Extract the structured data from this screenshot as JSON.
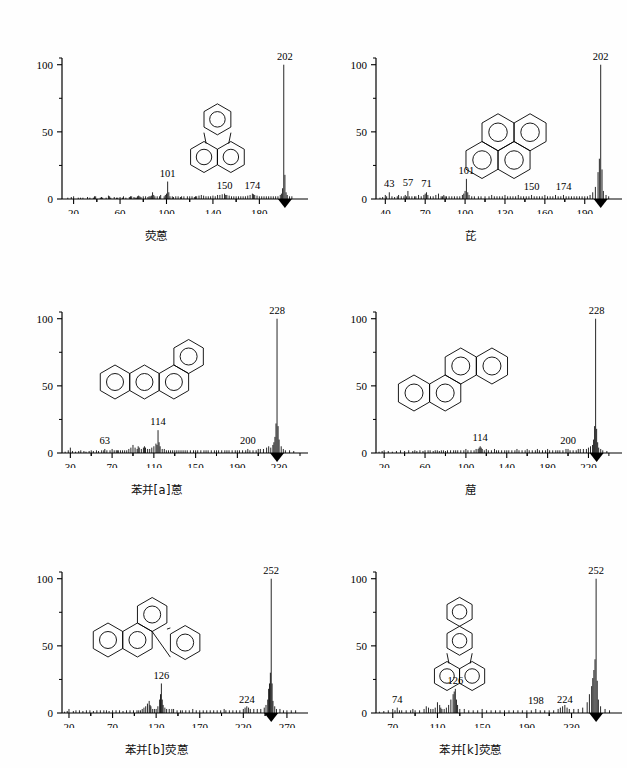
{
  "figure": {
    "type": "multi-panel-mass-spectra",
    "panel_count": 6,
    "y_axis_ticks": [
      "0",
      "50",
      "100"
    ],
    "y_minor_ticks": [
      25,
      75
    ],
    "y_range": [
      0,
      105
    ]
  },
  "chart_data": [
    {
      "type": "bar",
      "id": "panel-1",
      "title": "荧蒽",
      "title_en": "fluoranthene",
      "structure": "fluoranthene",
      "xlabel": "",
      "ylabel": "",
      "xlim": [
        10,
        215
      ],
      "ylim": [
        0,
        105
      ],
      "xticks": [
        20,
        60,
        100,
        140,
        180
      ],
      "yticks": [
        0,
        50,
        100
      ],
      "annotations": [
        {
          "mz": 101,
          "label": "101",
          "intensity": 13
        },
        {
          "mz": 150,
          "label": "150",
          "intensity": 4
        },
        {
          "mz": 174,
          "label": "174",
          "intensity": 4
        },
        {
          "mz": 202,
          "label": "202",
          "intensity": 100
        }
      ],
      "base_peak": 202,
      "x": [
        15,
        18,
        20,
        24,
        26,
        28,
        32,
        34,
        37,
        38,
        39,
        43,
        44,
        45,
        48,
        50,
        51,
        52,
        55,
        57,
        58,
        60,
        62,
        63,
        65,
        68,
        69,
        70,
        72,
        73,
        74,
        75,
        76,
        77,
        78,
        80,
        82,
        84,
        85,
        86,
        87,
        88,
        89,
        90,
        92,
        94,
        95,
        98,
        99,
        100,
        101,
        102,
        103,
        105,
        106,
        108,
        110,
        112,
        113,
        115,
        118,
        120,
        122,
        124,
        125,
        126,
        128,
        130,
        132,
        134,
        136,
        138,
        140,
        142,
        144,
        146,
        148,
        150,
        151,
        152,
        154,
        156,
        158,
        160,
        162,
        164,
        166,
        168,
        170,
        172,
        174,
        175,
        176,
        178,
        180,
        182,
        184,
        186,
        188,
        190,
        192,
        194,
        196,
        198,
        199,
        200,
        201,
        202,
        203,
        204,
        206,
        208,
        210
      ],
      "values": [
        1,
        1.5,
        2,
        1,
        1,
        1,
        1.5,
        1,
        1,
        2,
        2,
        1,
        1.5,
        1,
        1,
        2.5,
        2,
        1,
        1.5,
        1,
        1,
        1.5,
        1,
        2,
        1,
        1.5,
        2,
        2,
        1.5,
        1,
        1,
        2,
        2.5,
        2,
        1.5,
        2,
        2,
        1.5,
        2,
        2,
        2.5,
        5,
        3,
        2,
        2,
        2,
        3,
        2,
        3,
        4,
        13,
        5,
        2,
        2,
        1.5,
        2,
        2,
        1.5,
        2,
        2,
        2,
        2,
        2,
        1.5,
        2,
        2,
        2.5,
        3,
        2.5,
        2,
        2,
        2,
        2.5,
        2,
        3,
        3,
        3.5,
        4,
        3,
        3,
        2.5,
        2,
        2,
        2,
        2,
        2,
        2,
        2,
        2.5,
        3,
        4,
        3.5,
        3,
        2.5,
        2,
        2,
        2,
        2,
        2,
        2,
        2,
        2,
        2,
        3,
        4,
        8,
        100,
        18,
        5,
        3,
        2,
        2
      ]
    },
    {
      "type": "bar",
      "id": "panel-2",
      "title": "芘",
      "title_en": "pyrene",
      "structure": "pyrene",
      "xlabel": "",
      "ylabel": "",
      "xlim": [
        33,
        212
      ],
      "ylim": [
        0,
        105
      ],
      "xticks": [
        40,
        70,
        100,
        130,
        160,
        190
      ],
      "yticks": [
        0,
        50,
        100
      ],
      "annotations": [
        {
          "mz": 43,
          "label": "43",
          "intensity": 5
        },
        {
          "mz": 57,
          "label": "57",
          "intensity": 6
        },
        {
          "mz": 71,
          "label": "71",
          "intensity": 5
        },
        {
          "mz": 101,
          "label": "101",
          "intensity": 15
        },
        {
          "mz": 150,
          "label": "150",
          "intensity": 3
        },
        {
          "mz": 174,
          "label": "174",
          "intensity": 3
        },
        {
          "mz": 202,
          "label": "202",
          "intensity": 100
        }
      ],
      "base_peak": 202,
      "x": [
        36,
        38,
        40,
        41,
        43,
        45,
        47,
        49,
        50,
        52,
        54,
        55,
        56,
        57,
        58,
        60,
        62,
        63,
        65,
        67,
        69,
        70,
        71,
        72,
        74,
        76,
        78,
        80,
        82,
        83,
        84,
        85,
        86,
        88,
        90,
        92,
        94,
        96,
        98,
        99,
        100,
        101,
        102,
        103,
        105,
        107,
        110,
        112,
        115,
        118,
        120,
        122,
        124,
        126,
        128,
        130,
        132,
        134,
        136,
        138,
        140,
        142,
        144,
        146,
        148,
        150,
        152,
        154,
        156,
        158,
        160,
        162,
        164,
        166,
        168,
        170,
        172,
        174,
        176,
        178,
        180,
        182,
        184,
        186,
        188,
        190,
        192,
        194,
        196,
        198,
        200,
        201,
        202,
        203,
        204,
        206,
        208
      ],
      "values": [
        1,
        1.5,
        3,
        2,
        5,
        2,
        1.5,
        2,
        3,
        2,
        2,
        3,
        2,
        6,
        2,
        2,
        2,
        2,
        3,
        2,
        3,
        4,
        5,
        3,
        2,
        2,
        3,
        4,
        2,
        2,
        3,
        2,
        2,
        2,
        2,
        2,
        2,
        2,
        3,
        4,
        6,
        15,
        5,
        3,
        2,
        2,
        2,
        2,
        2,
        2,
        3,
        2,
        2,
        2,
        2,
        3,
        2,
        2,
        2,
        2,
        3,
        2,
        2,
        2,
        2,
        3,
        2,
        2,
        2,
        2,
        3,
        2,
        2,
        2,
        3,
        2,
        2,
        3,
        2,
        2,
        2,
        2,
        2,
        2,
        2,
        2,
        2,
        3,
        5,
        9,
        20,
        30,
        100,
        22,
        6,
        3,
        2
      ]
    },
    {
      "type": "bar",
      "id": "panel-3",
      "title": "苯并[a]蒽",
      "title_en": "benzo[a]anthracene",
      "structure": "benzo-a-anthracene",
      "xlabel": "",
      "ylabel": "",
      "xlim": [
        22,
        250
      ],
      "ylim": [
        0,
        105
      ],
      "xticks": [
        30,
        70,
        110,
        150,
        190,
        230
      ],
      "yticks": [
        0,
        50,
        100
      ],
      "annotations": [
        {
          "mz": 63,
          "label": "63",
          "intensity": 3
        },
        {
          "mz": 114,
          "label": "114",
          "intensity": 17
        },
        {
          "mz": 200,
          "label": "200",
          "intensity": 3
        },
        {
          "mz": 228,
          "label": "228",
          "intensity": 100
        }
      ],
      "base_peak": 228,
      "x": [
        25,
        28,
        30,
        32,
        35,
        38,
        40,
        43,
        45,
        48,
        50,
        52,
        55,
        57,
        60,
        62,
        63,
        65,
        68,
        70,
        72,
        74,
        75,
        76,
        78,
        80,
        82,
        84,
        86,
        88,
        90,
        92,
        94,
        95,
        96,
        98,
        100,
        101,
        102,
        104,
        106,
        108,
        110,
        112,
        113,
        114,
        115,
        116,
        118,
        120,
        122,
        124,
        126,
        128,
        130,
        132,
        134,
        136,
        138,
        140,
        142,
        145,
        148,
        150,
        152,
        155,
        158,
        160,
        162,
        165,
        168,
        170,
        172,
        175,
        178,
        180,
        182,
        185,
        188,
        190,
        192,
        195,
        198,
        200,
        202,
        205,
        208,
        210,
        212,
        215,
        218,
        220,
        222,
        224,
        225,
        226,
        227,
        228,
        229,
        230,
        232,
        234,
        236,
        240,
        244
      ],
      "values": [
        1,
        2,
        4,
        1.5,
        1,
        1.5,
        2,
        1.5,
        1,
        1.5,
        2,
        1.5,
        2,
        1.5,
        2,
        2,
        3,
        2,
        2,
        3,
        2,
        2,
        2,
        2,
        2,
        2,
        2,
        2,
        3,
        4,
        6,
        4,
        3,
        5,
        4,
        3,
        4,
        5,
        4,
        3,
        3,
        4,
        5,
        7,
        6,
        17,
        8,
        5,
        3,
        3,
        2,
        2,
        2,
        2,
        2,
        2,
        2,
        2,
        2,
        2,
        2,
        2,
        2,
        2,
        2,
        2,
        2,
        2,
        2,
        2,
        2,
        2,
        2,
        2,
        2,
        2,
        2,
        2,
        2,
        2,
        2,
        2,
        2,
        3,
        2,
        2,
        2,
        3,
        3,
        3,
        4,
        5,
        4,
        6,
        8,
        12,
        22,
        100,
        20,
        10,
        5,
        3,
        2,
        2,
        1.5
      ]
    },
    {
      "type": "bar",
      "id": "panel-4",
      "title": "䓛",
      "title_en": "chrysene",
      "structure": "chrysene",
      "xlabel": "",
      "ylabel": "",
      "xlim": [
        12,
        245
      ],
      "ylim": [
        0,
        105
      ],
      "xticks": [
        20,
        60,
        100,
        140,
        180,
        220
      ],
      "yticks": [
        0,
        50,
        100
      ],
      "annotations": [
        {
          "mz": 114,
          "label": "114",
          "intensity": 5
        },
        {
          "mz": 200,
          "label": "200",
          "intensity": 3
        },
        {
          "mz": 228,
          "label": "228",
          "intensity": 100
        }
      ],
      "base_peak": 228,
      "x": [
        15,
        18,
        20,
        24,
        28,
        32,
        36,
        40,
        44,
        48,
        50,
        52,
        55,
        58,
        60,
        63,
        65,
        68,
        70,
        72,
        74,
        76,
        78,
        80,
        82,
        85,
        88,
        90,
        92,
        95,
        98,
        100,
        102,
        105,
        108,
        110,
        112,
        113,
        114,
        115,
        116,
        118,
        120,
        122,
        125,
        128,
        130,
        132,
        135,
        138,
        140,
        142,
        145,
        148,
        150,
        152,
        155,
        158,
        160,
        162,
        165,
        168,
        170,
        172,
        175,
        178,
        180,
        182,
        185,
        188,
        190,
        192,
        195,
        198,
        200,
        202,
        205,
        208,
        210,
        212,
        215,
        218,
        220,
        222,
        224,
        225,
        226,
        227,
        228,
        229,
        230,
        232,
        234,
        238,
        242
      ],
      "values": [
        1,
        1.5,
        2,
        1.5,
        1,
        1.5,
        2,
        1.5,
        2,
        1.5,
        2,
        1.5,
        2,
        1.5,
        2,
        2,
        2,
        1.5,
        2,
        2,
        1.5,
        2,
        2,
        1.5,
        2,
        2,
        2,
        2,
        2,
        2,
        2,
        3,
        2,
        2,
        2,
        3,
        3,
        4,
        5,
        4,
        3,
        2,
        3,
        2,
        2,
        3,
        2,
        2,
        2,
        2,
        2,
        2,
        2,
        2,
        3,
        2,
        2,
        2,
        3,
        2,
        2,
        2,
        3,
        2,
        2,
        2,
        3,
        2,
        2,
        2,
        2,
        2,
        2,
        3,
        3,
        2,
        2,
        2,
        3,
        3,
        3,
        3,
        4,
        5,
        6,
        10,
        20,
        100,
        18,
        8,
        4,
        3,
        2,
        1.5
      ]
    },
    {
      "type": "bar",
      "id": "panel-5",
      "title": "苯并[b]荧蒽",
      "title_en": "benzo[b]fluoranthene",
      "structure": "benzo-b-fluoranthene",
      "xlabel": "",
      "ylabel": "",
      "xlim": [
        12,
        285
      ],
      "ylim": [
        0,
        105
      ],
      "xticks": [
        20,
        70,
        120,
        170,
        220,
        270
      ],
      "yticks": [
        0,
        50,
        100
      ],
      "annotations": [
        {
          "mz": 126,
          "label": "126",
          "intensity": 22
        },
        {
          "mz": 224,
          "label": "224",
          "intensity": 4
        },
        {
          "mz": 252,
          "label": "252",
          "intensity": 100
        }
      ],
      "base_peak": 252,
      "x": [
        15,
        18,
        20,
        25,
        28,
        32,
        36,
        40,
        44,
        48,
        52,
        56,
        60,
        63,
        66,
        70,
        74,
        78,
        82,
        86,
        90,
        94,
        98,
        100,
        102,
        104,
        106,
        108,
        110,
        112,
        113,
        114,
        116,
        118,
        120,
        122,
        124,
        125,
        126,
        127,
        128,
        130,
        132,
        135,
        138,
        140,
        144,
        148,
        150,
        154,
        158,
        162,
        166,
        170,
        174,
        178,
        182,
        186,
        190,
        194,
        198,
        200,
        204,
        208,
        212,
        216,
        220,
        222,
        224,
        226,
        228,
        232,
        236,
        240,
        244,
        246,
        248,
        249,
        250,
        251,
        252,
        253,
        254,
        256,
        258,
        262,
        266,
        270,
        275,
        280
      ],
      "values": [
        1,
        1.5,
        3,
        1.5,
        2,
        2,
        1.5,
        2,
        2,
        1.5,
        2,
        2,
        2,
        2,
        1.5,
        2,
        2,
        2,
        1.5,
        2,
        2,
        2,
        2,
        2,
        2,
        3,
        4,
        5,
        7,
        9,
        6,
        5,
        3,
        3,
        3,
        5,
        10,
        14,
        22,
        10,
        6,
        4,
        3,
        3,
        3,
        3,
        2,
        2,
        2,
        2,
        2,
        3,
        2,
        2,
        2,
        2,
        2,
        2,
        2,
        2,
        3,
        2,
        2,
        2,
        2,
        2,
        3,
        4,
        5,
        4,
        3,
        3,
        3,
        3,
        4,
        6,
        10,
        18,
        22,
        30,
        100,
        22,
        9,
        5,
        3,
        3,
        2,
        2,
        2,
        2
      ]
    },
    {
      "type": "bar",
      "id": "panel-6",
      "title": "苯并[k]荧蒽",
      "title_en": "benzo[k]fluoranthene",
      "structure": "benzo-k-fluoranthene",
      "xlabel": "",
      "ylabel": "",
      "xlim": [
        55,
        268
      ],
      "ylim": [
        0,
        105
      ],
      "xticks": [
        70,
        110,
        150,
        190,
        230
      ],
      "yticks": [
        0,
        50,
        100
      ],
      "annotations": [
        {
          "mz": 74,
          "label": "74",
          "intensity": 4
        },
        {
          "mz": 126,
          "label": "126",
          "intensity": 18
        },
        {
          "mz": 198,
          "label": "198",
          "intensity": 3
        },
        {
          "mz": 224,
          "label": "224",
          "intensity": 4
        },
        {
          "mz": 252,
          "label": "252",
          "intensity": 100
        }
      ],
      "base_peak": 252,
      "x": [
        58,
        62,
        66,
        70,
        72,
        74,
        76,
        78,
        82,
        86,
        88,
        90,
        94,
        98,
        100,
        102,
        104,
        106,
        108,
        110,
        112,
        113,
        114,
        116,
        118,
        120,
        122,
        124,
        125,
        126,
        127,
        128,
        130,
        134,
        138,
        142,
        146,
        150,
        154,
        158,
        162,
        166,
        170,
        174,
        178,
        182,
        186,
        190,
        194,
        198,
        202,
        206,
        210,
        214,
        218,
        220,
        222,
        224,
        226,
        228,
        232,
        236,
        240,
        244,
        246,
        248,
        249,
        250,
        251,
        252,
        253,
        254,
        256,
        260,
        264
      ],
      "values": [
        1,
        1.5,
        2,
        3,
        2,
        4,
        2,
        2,
        2,
        2,
        3,
        2,
        2,
        3,
        5,
        4,
        3,
        3,
        4,
        8,
        6,
        4,
        3,
        3,
        4,
        6,
        10,
        14,
        16,
        18,
        10,
        6,
        3,
        3,
        2,
        2,
        2,
        3,
        2,
        2,
        2,
        2,
        2,
        2,
        2,
        2,
        2,
        2,
        2,
        3,
        2,
        2,
        2,
        2,
        3,
        4,
        5,
        6,
        4,
        3,
        3,
        3,
        4,
        8,
        14,
        20,
        26,
        32,
        40,
        100,
        24,
        10,
        5,
        3,
        2
      ]
    }
  ]
}
